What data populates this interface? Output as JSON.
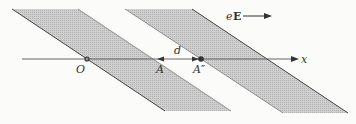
{
  "diagram": {
    "field_label": {
      "e": "e",
      "E": "E"
    },
    "axis_label": "x",
    "points": [
      {
        "id": "O",
        "label": "O"
      },
      {
        "id": "A",
        "label": "A"
      },
      {
        "id": "A2",
        "label": "A″"
      }
    ],
    "distance_label": "d",
    "bands": 2,
    "colors": {
      "band_fill": "#c9c9c9",
      "line": "#444444",
      "background": "#fbfbfa"
    }
  }
}
